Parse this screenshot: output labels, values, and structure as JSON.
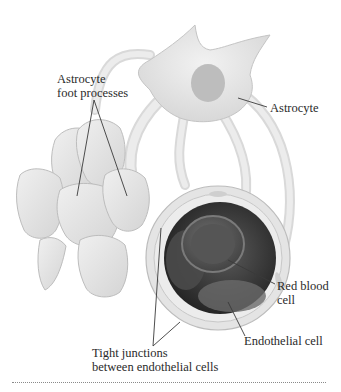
{
  "figure": {
    "labels": {
      "astrocyte_foot_processes": [
        "Astrocyte",
        "foot processes"
      ],
      "astrocyte": "Astrocyte",
      "red_blood_cell": [
        "Red blood",
        "cell"
      ],
      "endothelial_cell": "Endothelial cell",
      "tight_junctions": [
        "Tight junctions",
        "between endothelial cells"
      ]
    },
    "colors": {
      "cell_body": "#e6e6e6",
      "cell_outline": "#b8b8b8",
      "nucleus": "#bdbdbd",
      "lumen_dark": "#3c3c3c",
      "rbc": "#5a5a5a",
      "leader_line": "#3a3a3a",
      "divider": "#8a8a8a"
    }
  }
}
